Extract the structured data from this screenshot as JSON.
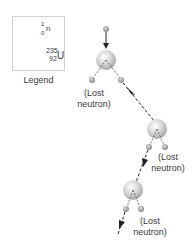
{
  "legend": {
    "title": "Legend",
    "items": [
      {
        "icon": "neutron-icon",
        "mass": "1",
        "atomic": "0",
        "symbol": "n"
      },
      {
        "icon": "uranium-nucleus-icon",
        "mass": "235",
        "atomic": "92",
        "symbol": "U"
      }
    ]
  },
  "labels": {
    "lost1_line1": "(Lost",
    "lost1_line2": "neutron)",
    "lost2_line1": "(Lost",
    "lost2_line2": "neutron)",
    "lost3_line1": "(Lost",
    "lost3_line2": "neutron)"
  },
  "colors": {
    "nucleus": "#c8c8c8",
    "neutron": "#9a9a9a",
    "arrow": "#222222"
  }
}
